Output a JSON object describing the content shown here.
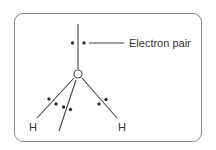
{
  "diagram": {
    "type": "water molecule lone pair / bonding diagram",
    "labels": {
      "electron_pair": "Electron pair",
      "oxygen": "O",
      "hydrogen_left": "H",
      "hydrogen_right": "H"
    },
    "colors": {
      "frame": "#8a8a8a",
      "lines": "#444444",
      "dots": "#333333",
      "text": "#333333"
    }
  }
}
